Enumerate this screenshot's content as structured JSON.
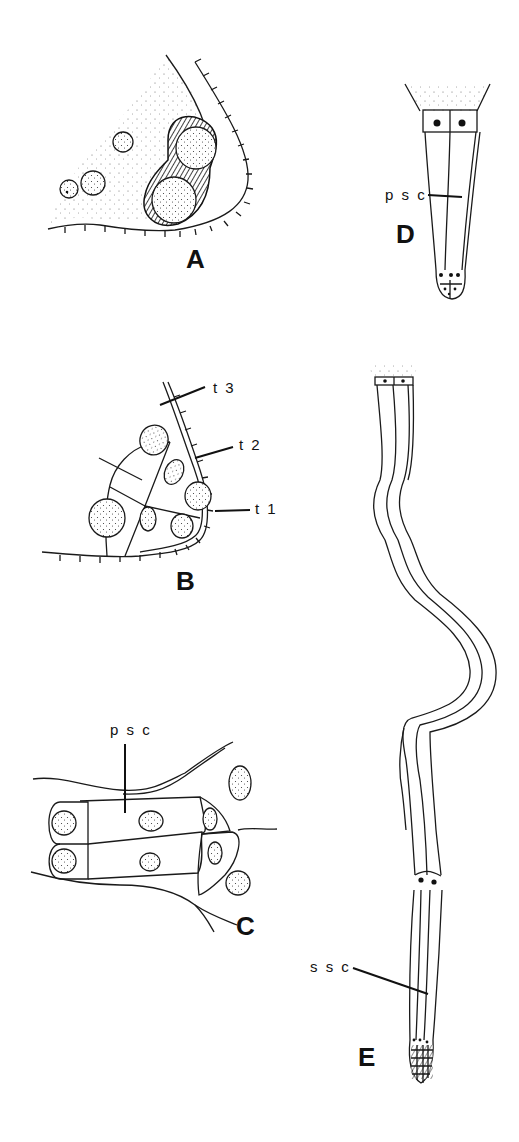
{
  "figure": {
    "panels": [
      {
        "id": "A",
        "label": "A",
        "annotations": []
      },
      {
        "id": "B",
        "label": "B",
        "annotations": [
          "t3",
          "t2",
          "t1"
        ]
      },
      {
        "id": "C",
        "label": "C",
        "annotations": [
          "psc"
        ]
      },
      {
        "id": "D",
        "label": "D",
        "annotations": [
          "psc"
        ]
      },
      {
        "id": "E",
        "label": "E",
        "annotations": [
          "ssc"
        ]
      }
    ],
    "labels": {
      "A": "A",
      "B": "B",
      "C": "C",
      "D": "D",
      "E": "E",
      "b_t3": "t 3",
      "b_t2": "t 2",
      "b_t1": "t 1",
      "c_psc": "p s c",
      "d_psc": "p s c",
      "e_ssc": "s s c"
    },
    "colors": {
      "ink": "#111111",
      "background": "#ffffff"
    }
  }
}
